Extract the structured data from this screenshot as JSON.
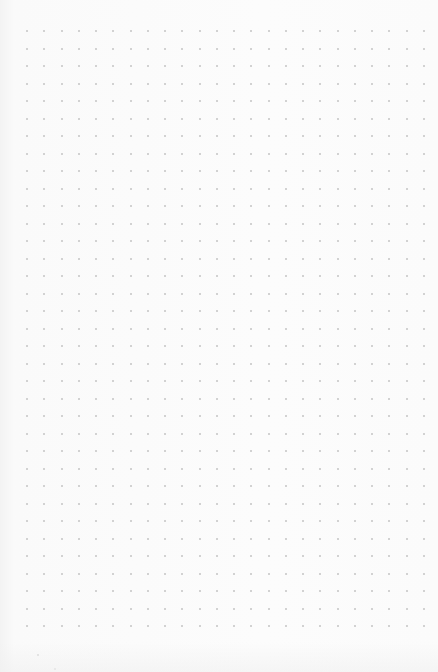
{
  "canvas": {
    "type": "dot-grid-paper",
    "background_color": "#fbfbfb",
    "dot_color": "#c4c4c4",
    "grid": {
      "columns": 24,
      "rows": 35,
      "origin_x": 27,
      "origin_y": 31,
      "spacing_x": 17.26,
      "spacing_y": 17.5,
      "dot_size": 2
    },
    "stray_dots": [
      {
        "x": 37,
        "y": 654
      },
      {
        "x": 54,
        "y": 668
      }
    ]
  }
}
